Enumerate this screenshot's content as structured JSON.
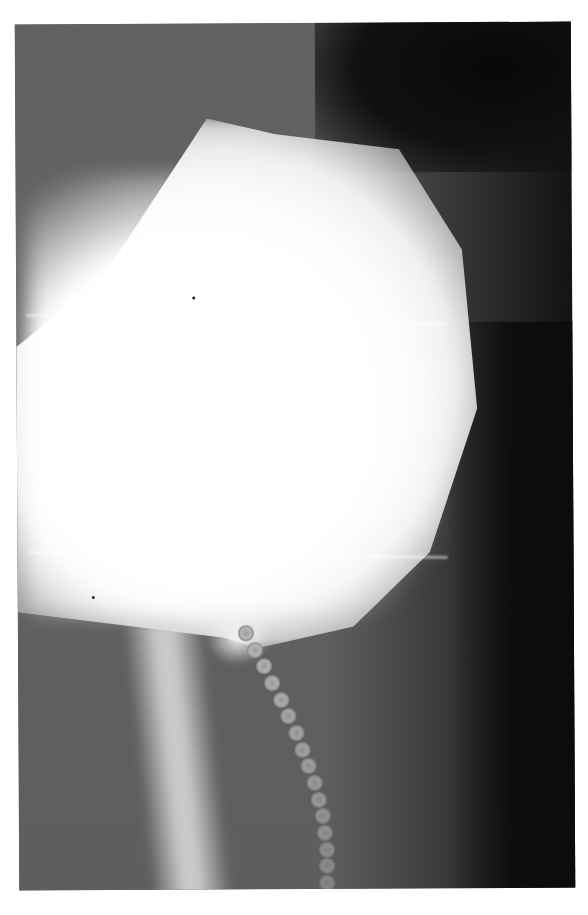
{
  "image": {
    "kind": "radiograph",
    "description": "Grayscale contrast X-ray showing a bright contrast-filled bladder with a bead chain extending downward from the bladder neck",
    "background_color": "#ffffff",
    "tones": {
      "soft_tissue": "#5e5e5e",
      "dark_region": "#0c0c0c",
      "contrast_fill": "#ffffff"
    },
    "bead_chain": {
      "bead_count": 16
    }
  }
}
